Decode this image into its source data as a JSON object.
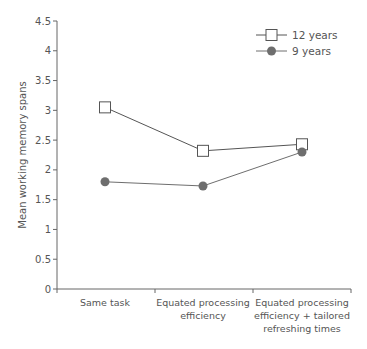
{
  "chart_data": {
    "type": "line",
    "title": "",
    "xlabel": "",
    "ylabel": "Mean working memory spans",
    "ylim": [
      0,
      4.5
    ],
    "yticks": [
      "0",
      "0.5",
      "1",
      "1.5",
      "2",
      "2.5",
      "3",
      "3.5",
      "4",
      "4.5"
    ],
    "grid": false,
    "legend_position": "top-right",
    "categories": [
      [
        "Same task"
      ],
      [
        "Equated processing",
        "efficiency"
      ],
      [
        "Equated processing",
        "efficiency + tailored",
        "refreshing times"
      ]
    ],
    "series": [
      {
        "name": "12 years",
        "marker": "open-square",
        "color": "#555555",
        "values": [
          3.05,
          2.32,
          2.43
        ]
      },
      {
        "name": "9 years",
        "marker": "filled-circle",
        "color": "#6e6e6e",
        "values": [
          1.8,
          1.73,
          2.3
        ]
      }
    ]
  }
}
